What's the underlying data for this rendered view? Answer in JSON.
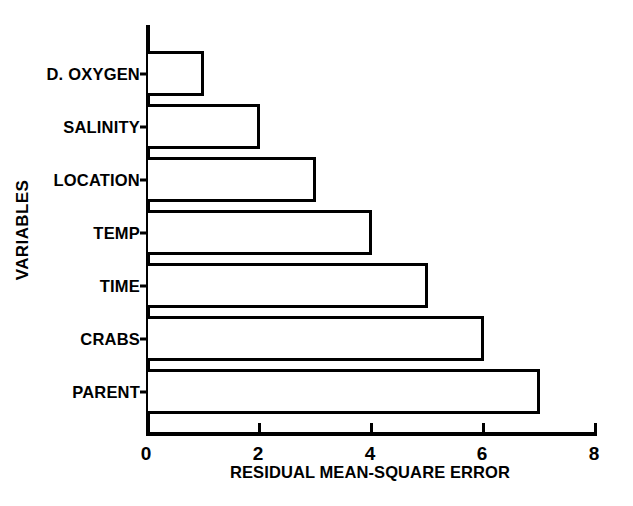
{
  "chart_data": {
    "type": "bar",
    "orientation": "horizontal",
    "title": "",
    "xlabel": "RESIDUAL MEAN-SQUARE ERROR",
    "ylabel": "VARIABLES",
    "categories": [
      "D. OXYGEN",
      "SALINITY",
      "LOCATION",
      "TEMP",
      "TIME",
      "CRABS",
      "PARENT"
    ],
    "values": [
      1,
      2,
      3,
      4,
      5,
      6,
      7
    ],
    "xlim": [
      0,
      8
    ],
    "xticks": [
      0,
      2,
      4,
      6,
      8
    ],
    "xtick_labels": [
      "0",
      "2",
      "4",
      "6",
      "8"
    ],
    "grid": false,
    "legend": null,
    "bar_fill_color": "#ffffff",
    "bar_edge_color": "#000000",
    "background_color": "#ffffff",
    "text_color": "#000000"
  }
}
